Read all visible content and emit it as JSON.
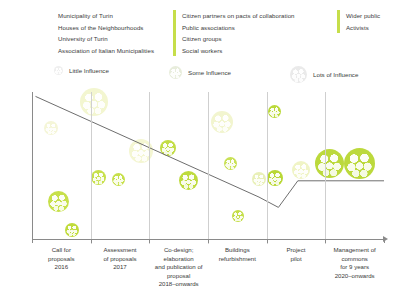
{
  "legend_groups": {
    "columns": [
      {
        "accent": "#c6de4a",
        "has_bar": false,
        "items": [
          "Municipality of Turin",
          "Houses of the Neighbourhoods",
          "University of Turin",
          "Association of Italian Municipalities"
        ]
      },
      {
        "accent": "#c6de4a",
        "has_bar": true,
        "items": [
          "Citizen partners on pacts of collaboration",
          "Public associations",
          "Citizen groups",
          "Social workers"
        ]
      },
      {
        "accent": "#c6de4a",
        "has_bar": true,
        "items": [
          "Wider public",
          "Activists"
        ]
      }
    ]
  },
  "legend_influence": {
    "items": [
      {
        "label": "Little Influence",
        "size": 9,
        "color": "#efefef"
      },
      {
        "label": "Some Influence",
        "size": 13,
        "color": "#e8eddc"
      },
      {
        "label": "Lots of Influence",
        "size": 17,
        "color": "#eaeaea"
      }
    ]
  },
  "chart_data": {
    "type": "scatter",
    "title": "",
    "xlabel": "",
    "ylabel": "Interest",
    "grid": true,
    "legend_position": "top",
    "categories": [
      "Call for proposals 2016",
      "Assessment of proposals 2017",
      "Co-design; elaboration and publication of proposal 2018–onwards",
      "Buildings refurbishment",
      "Project pilot",
      "Management of commons for 9 years 2020–onwards"
    ],
    "category_lines": [
      [
        "Call for",
        "proposals",
        "2016"
      ],
      [
        "Assessment",
        "of proposals",
        "2017"
      ],
      [
        "Co-design; elaboration",
        "and publication of proposal",
        "2018–onwards"
      ],
      [
        "Buildings",
        "refurbishment",
        ""
      ],
      [
        "Project",
        "pilot",
        ""
      ],
      [
        "Management of commons",
        "for 9 years",
        "2020–onwards"
      ]
    ],
    "trend_line": {
      "label": "overall interest trend",
      "points": [
        [
          0.01,
          0.97
        ],
        [
          0.645,
          0.29
        ],
        [
          0.7,
          0.22
        ],
        [
          0.755,
          0.4
        ],
        [
          1.0,
          0.4
        ]
      ],
      "color": "#6e6e6e"
    },
    "points": [
      {
        "x": 0.055,
        "y": 0.76,
        "size": 14,
        "influence": "little",
        "color": "#f5f6d8"
      },
      {
        "x": 0.075,
        "y": 0.26,
        "size": 21,
        "influence": "some",
        "color": "#c7e04b"
      },
      {
        "x": 0.115,
        "y": 0.07,
        "size": 14,
        "influence": "little",
        "color": "#c0db3c"
      },
      {
        "x": 0.175,
        "y": 0.93,
        "size": 28,
        "influence": "lots",
        "color": "#f3f6d0"
      },
      {
        "x": 0.19,
        "y": 0.42,
        "size": 15,
        "influence": "some",
        "color": "#c7e04b"
      },
      {
        "x": 0.245,
        "y": 0.41,
        "size": 13,
        "influence": "little",
        "color": "#c7e04b"
      },
      {
        "x": 0.31,
        "y": 0.6,
        "size": 24,
        "influence": "lots",
        "color": "#f4f6d2"
      },
      {
        "x": 0.385,
        "y": 0.62,
        "size": 16,
        "influence": "some",
        "color": "#c3dd46"
      },
      {
        "x": 0.445,
        "y": 0.4,
        "size": 19,
        "influence": "some",
        "color": "#bedb3e"
      },
      {
        "x": 0.54,
        "y": 0.8,
        "size": 22,
        "influence": "lots",
        "color": "#f2f5cf"
      },
      {
        "x": 0.565,
        "y": 0.52,
        "size": 13,
        "influence": "little",
        "color": "#c9e156"
      },
      {
        "x": 0.585,
        "y": 0.16,
        "size": 12,
        "influence": "little",
        "color": "#c4de48"
      },
      {
        "x": 0.645,
        "y": 0.41,
        "size": 14,
        "influence": "little",
        "color": "#e9f0b9"
      },
      {
        "x": 0.69,
        "y": 0.87,
        "size": 13,
        "influence": "little",
        "color": "#bbd93a"
      },
      {
        "x": 0.69,
        "y": 0.42,
        "size": 16,
        "influence": "some",
        "color": "#b9d836"
      },
      {
        "x": 0.765,
        "y": 0.47,
        "size": 18,
        "influence": "little",
        "color": "#f0f4c6"
      },
      {
        "x": 0.845,
        "y": 0.52,
        "size": 29,
        "influence": "lots",
        "color": "#bcd93c"
      },
      {
        "x": 0.93,
        "y": 0.52,
        "size": 31,
        "influence": "lots",
        "color": "#bcd93c"
      }
    ]
  }
}
